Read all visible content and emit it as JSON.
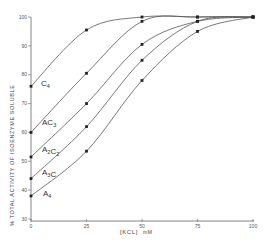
{
  "chart_data": {
    "type": "line",
    "title": "",
    "xlabel": "[KCL] mM",
    "ylabel": "% TOTAL ACTIVITY OF ISOENZYME SOLUBLE",
    "xlim": [
      0,
      100
    ],
    "ylim": [
      30,
      100
    ],
    "x_ticks": [
      0,
      25,
      50,
      75,
      100
    ],
    "y_ticks": [
      30,
      40,
      50,
      60,
      70,
      80,
      90,
      100
    ],
    "grid": false,
    "legend": "inline labels near curves",
    "x": [
      0,
      25,
      50,
      75,
      100
    ],
    "series": [
      {
        "name": "C4",
        "label_main": "C",
        "label_sub": "4",
        "values": [
          76,
          95.5,
          100,
          100,
          100
        ]
      },
      {
        "name": "AC3",
        "label_main": "AC",
        "label_sub": "3",
        "values": [
          60,
          80.5,
          98.5,
          100,
          100
        ]
      },
      {
        "name": "A2C2",
        "label_main": "A2C",
        "label_sub": "2",
        "values": [
          51.5,
          70,
          90.5,
          98.5,
          100
        ]
      },
      {
        "name": "A3C",
        "label_main": "A3C",
        "label_sub": "",
        "values": [
          44,
          62,
          85,
          98.5,
          100
        ]
      },
      {
        "name": "A4",
        "label_main": "A",
        "label_sub": "4",
        "values": [
          38,
          53.5,
          78,
          95,
          100
        ]
      }
    ]
  },
  "axis": {
    "x_label_bracket": "[KCL]",
    "x_label_unit": "mM",
    "y_label": "% TOTAL ACTIVITY OF ISOENZYME SOLUBLE",
    "x_tick_labels": [
      "0",
      "25",
      "50",
      "75",
      "100"
    ],
    "y_tick_labels": [
      "30",
      "40",
      "50",
      "60",
      "70",
      "80",
      "90",
      "100"
    ]
  },
  "colors": {
    "line": "#555555",
    "marker": "#222222",
    "axis": "#666666"
  }
}
